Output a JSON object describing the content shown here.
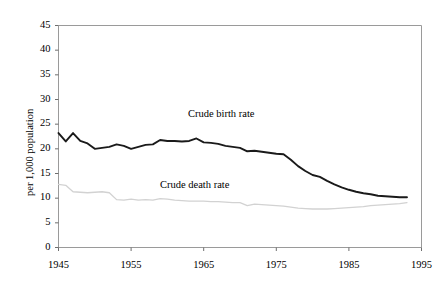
{
  "chart_data": {
    "type": "line",
    "title": "",
    "xlabel": "",
    "ylabel": "per 1,000 population",
    "xlim": [
      1945,
      1995
    ],
    "ylim": [
      0,
      45
    ],
    "grid": false,
    "legend_position": "inline-annotations",
    "xticks": [
      "1945",
      "1955",
      "1965",
      "1975",
      "1985",
      "1995"
    ],
    "xtick_values": [
      1945,
      1955,
      1965,
      1975,
      1985,
      1995
    ],
    "yticks": [
      "0",
      "5",
      "10",
      "15",
      "20",
      "25",
      "30",
      "35",
      "40",
      "45"
    ],
    "ytick_values": [
      0,
      5,
      10,
      15,
      20,
      25,
      30,
      35,
      40,
      45
    ],
    "x": [
      1945,
      1946,
      1947,
      1948,
      1949,
      1950,
      1951,
      1952,
      1953,
      1954,
      1955,
      1956,
      1957,
      1958,
      1959,
      1960,
      1961,
      1962,
      1963,
      1964,
      1965,
      1966,
      1967,
      1968,
      1969,
      1970,
      1971,
      1972,
      1973,
      1974,
      1975,
      1976,
      1977,
      1978,
      1979,
      1980,
      1981,
      1982,
      1983,
      1984,
      1985,
      1986,
      1987,
      1988,
      1989,
      1990,
      1991,
      1992,
      1993
    ],
    "series": [
      {
        "name": "Crude birth rate",
        "color": "#1a1a1a",
        "width": 1.9,
        "annotation": "Crude birth rate",
        "values": [
          23.2,
          21.5,
          23.2,
          21.6,
          21.1,
          20.0,
          20.2,
          20.4,
          20.9,
          20.6,
          20.0,
          20.4,
          20.8,
          20.9,
          21.8,
          21.6,
          21.6,
          21.5,
          21.6,
          22.1,
          21.3,
          21.2,
          21.0,
          20.6,
          20.4,
          20.2,
          19.5,
          19.6,
          19.4,
          19.2,
          19.0,
          18.9,
          17.8,
          16.5,
          15.5,
          14.7,
          14.3,
          13.5,
          12.8,
          12.2,
          11.7,
          11.3,
          11.0,
          10.8,
          10.5,
          10.4,
          10.3,
          10.2,
          10.2
        ]
      },
      {
        "name": "Crude death rate",
        "color": "#d2d2d2",
        "width": 1.3,
        "annotation": "Crude death rate",
        "values": [
          12.8,
          12.6,
          11.3,
          11.2,
          11.1,
          11.2,
          11.3,
          11.1,
          9.7,
          9.6,
          9.8,
          9.6,
          9.7,
          9.6,
          9.9,
          9.8,
          9.6,
          9.5,
          9.4,
          9.4,
          9.4,
          9.3,
          9.3,
          9.2,
          9.1,
          9.1,
          8.5,
          8.8,
          8.7,
          8.6,
          8.5,
          8.4,
          8.2,
          8.0,
          7.9,
          7.8,
          7.8,
          7.8,
          7.9,
          8.0,
          8.1,
          8.2,
          8.3,
          8.5,
          8.6,
          8.7,
          8.8,
          8.9,
          9.1
        ]
      }
    ]
  },
  "axis": {
    "y_title": "per 1,000 population"
  }
}
